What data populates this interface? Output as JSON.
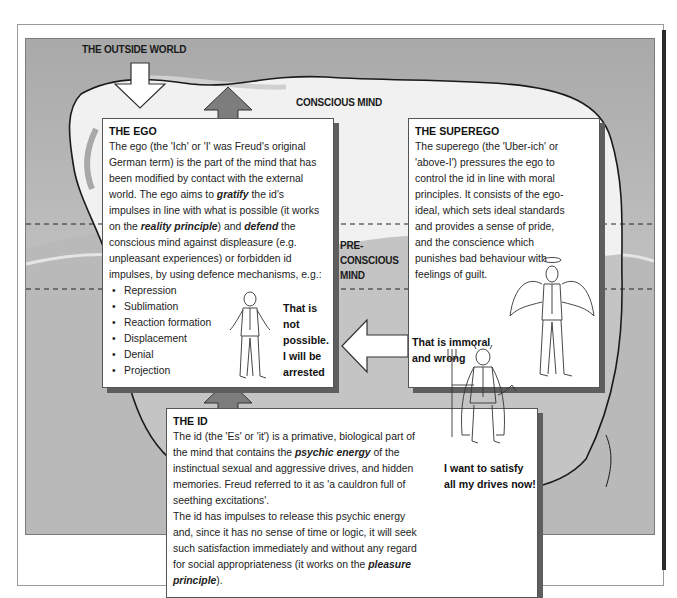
{
  "labels": {
    "outside_world": "THE OUTSIDE WORLD",
    "conscious_mind": "CONSCIOUS MIND",
    "preconscious_mind_line1": "PRE-",
    "preconscious_mind_line2": "CONSCIOUS",
    "preconscious_mind_line3": "MIND",
    "unconscious_mind": "UNCONSCIOUS MIND"
  },
  "ego": {
    "title": "THE EGO",
    "text_1": "The ego (the 'Ich' or 'I' was Freud's original German term) is the part of the mind that has been modified by contact with the external world. The ego aims to ",
    "emph_gratify": "gratify",
    "text_2": " the id's impulses in line with what is possible (it works on the ",
    "emph_reality": "reality principle",
    "text_3": ") and ",
    "emph_defend": "defend",
    "text_4": " the conscious mind against displeasure (e.g. unpleasant experiences) or forbidden id impulses, by using defence mechanisms, e.g.:",
    "mechanisms": [
      "Repression",
      "Sublimation",
      "Reaction formation",
      "Displacement",
      "Denial",
      "Projection"
    ],
    "speech_1": "That is",
    "speech_2": "not",
    "speech_3": "possible.",
    "speech_4": "I will be",
    "speech_5": "arrested"
  },
  "superego": {
    "title": "THE SUPEREGO",
    "text": "The superego (the 'Uber-ich' or 'above-I') pressures the ego to control the id in line with moral principles. It consists of the ego-ideal, which sets ideal standards and provides a sense of pride, and the conscience which punishes bad behaviour with feelings of guilt.",
    "speech_1": "That is immoral",
    "speech_2": "and wrong"
  },
  "id": {
    "title": "THE ID",
    "text_1": "The id (the 'Es' or 'it') is a primative, biological part of the mind that contains the ",
    "emph_psychic": "psychic energy",
    "text_2": " of the instinctual sexual and aggressive drives, and hidden memories. Freud referred to it as 'a cauldron full of seething excitations'.",
    "text_3": "The id has impulses to release this psychic energy and, since it has no sense of time or logic, it will seek such satisfaction immediately and without any regard for social appropriateness (it works on the ",
    "emph_pleasure": "pleasure principle",
    "text_4": ").",
    "speech_1": "I want to satisfy",
    "speech_2": "all my drives now!"
  },
  "colors": {
    "background_gray": "#b4b4b4",
    "arrow_dark": "#7d7d7d",
    "box_shadow": "#5e5e5e",
    "iceberg_outline": "#1a1a1a"
  },
  "icons": {
    "outside_arrow": "down-arrow-icon",
    "ego_up_arrow": "up-arrow-icon",
    "id_up_arrow": "up-arrow-icon",
    "superego_left_arrow": "left-arrow-icon",
    "ego_figure": "shrugging-man-icon",
    "superego_figure": "angel-man-icon",
    "id_figure": "devil-man-icon"
  }
}
